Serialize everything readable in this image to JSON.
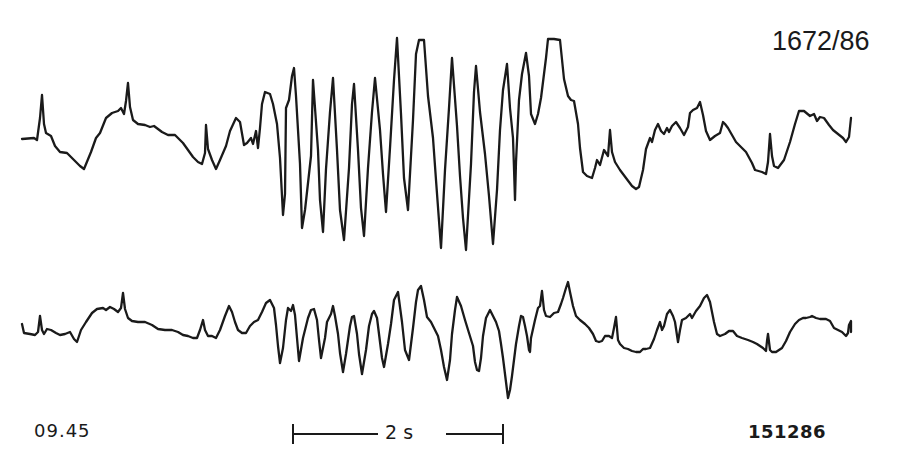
{
  "figure": {
    "case_id": "1672/86",
    "recording_time": "09.45",
    "recording_date": "151286",
    "scale_bar": {
      "label": "2 s"
    }
  },
  "traces": [
    {
      "name": "channel-1",
      "points": "22,139 34,138 37,140 40,118 42,95 44,124 46,133 51,136 55,146 60,152 67,153 74,160 80,166 84,169 91,152 96,138 100,133 106,118 112,113 118,111 121,108 124,114 126,101 128,83 130,107 133,120 138,124 145,125 150,127 154,126 162,132 168,135 175,135 183,143 188,150 193,157 198,162 202,164 205,153 206,125 208,149 212,160 216,169 220,160 226,146 230,131 236,118 240,122 244,145 247,143 251,138 253,144 256,131 258,148 260,128 262,104 265,92 270,94 273,104 277,124 280,158 283,215 285,194 286,108 289,100 292,76 294,68 296,96 300,164 302,228 305,210 311,156 313,80 318,150 320,200 323,232 326,169 330,112 333,78 337,150 340,210 344,240 349,168 352,104 354,84 358,150 361,208 364,236 368,168 372,112 375,78 380,130 383,174 386,212 390,148 394,80 397,38 401,114 404,178 408,210 413,120 416,54 419,40 424,40 428,96 433,138 436,180 441,248 445,170 449,108 452,58 457,126 460,176 463,218 466,250 471,164 474,92 476,66 480,112 485,154 489,196 493,244 497,190 500,130 503,90 507,64 510,108 513,138 514,168 515,200 516,162 519,100 522,74 526,53 529,76 531,114 535,124 538,114 541,98 546,58 548,39 554,39 560,40 564,79 568,96 571,100 574,101 578,124 580,148 583,172 587,176 592,178 595,168 597,160 600,165 604,150 608,156 610,130 612,152 615,162 620,170 626,178 632,186 636,189 639,187 643,170 646,149 650,138 652,142 655,130 658,124 661,131 664,134 667,128 669,132 672,126 676,122 680,128 684,135 688,127 690,113 693,110 697,108 700,102 703,115 706,131 710,140 715,136 720,133 723,122 725,124 728,128 732,135 736,142 742,148 746,152 752,163 755,170 762,172 766,174 768,162 770,134 772,156 774,166 778,168 784,160 790,142 795,124 799,111 804,111 810,116 814,114 817,121 820,117 824,118 829,125 833,130 838,134 843,138 846,142 849,137 851,118"
    },
    {
      "name": "channel-2",
      "points": "22,324 24,333 30,334 35,335 38,332 40,316 42,330 44,334 47,329 51,330 56,333 60,335 65,334 70,332 74,339 77,342 81,330 86,322 92,313 97,309 103,308 106,310 110,307 114,309 118,312 121,308 123,293 125,309 128,318 132,321 138,322 145,322 152,325 158,329 165,330 172,330 178,332 183,335 188,336 193,338 197,338 200,330 203,320 205,330 208,336 212,336 216,338 220,330 225,316 229,306 232,312 235,322 238,330 242,333 246,333 250,326 254,322 258,320 262,312 266,303 270,300 274,308 276,325 278,346 280,363 283,348 286,320 288,308 291,311 293,305 295,315 297,338 299,361 303,338 308,318 311,310 314,309 317,320 319,340 321,358 325,338 327,322 331,314 333,306 335,316 338,334 340,353 343,372 346,354 350,326 352,317 354,316 357,334 359,354 362,374 366,350 369,326 372,314 374,311 377,318 379,334 382,358 384,367 388,344 391,324 394,300 398,292 402,322 405,350 409,360 413,328 416,302 418,290 421,286 424,300 427,317 431,322 434,328 438,336 441,350 444,367 447,380 450,360 452,334 455,310 457,297 461,306 465,320 469,333 473,346 475,362 477,370 479,371 481,358 483,336 486,318 490,310 493,316 496,322 499,331 501,344 503,358 506,382 508,398 510,390 512,376 516,344 519,326 521,316 523,317 525,326 527,336 529,350 530,352 531,338 535,320 538,308 540,306 542,291 544,310 546,316 550,317 554,313 558,312 561,304 563,298 566,288 568,282 570,292 573,306 576,316 580,320 585,324 589,328 593,334 596,341 599,342 602,341 605,336 609,336 612,338 614,328 616,317 618,340 620,344 624,348 628,349 632,351 636,352 640,352 643,349 646,349 650,348 654,339 657,330 660,322 662,330 664,326 667,314 670,310 673,316 675,322 678,342 680,330 682,320 686,318 690,314 692,318 696,311 700,306 704,298 707,295 710,302 712,312 714,322 717,334 720,336 725,334 729,331 733,331 737,336 742,338 748,340 753,342 757,344 760,346 763,348 766,351 767,341 768,334 770,350 772,352 776,352 782,348 786,341 790,332 795,324 799,320 803,318 806,318 810,317 812,316 816,318 820,319 826,319 830,321 834,328 838,330 842,332 846,336 848,333 849,325 851,321 851,332"
    }
  ],
  "chart_data": {
    "type": "line",
    "title": "1672/86",
    "xlabel": "",
    "ylabel": "",
    "annotations": [
      "09.45",
      "151286",
      "2 s scale bar"
    ],
    "grid": false,
    "legend": null,
    "series": [
      {
        "name": "channel-1",
        "description": "EEG trace with high-amplitude rhythmic burst (~13 waves) between ~2.7 s and ~5.5 s"
      },
      {
        "name": "channel-2",
        "description": "EEG trace with lower-amplitude synchronous rhythmic burst in the same interval"
      }
    ]
  }
}
